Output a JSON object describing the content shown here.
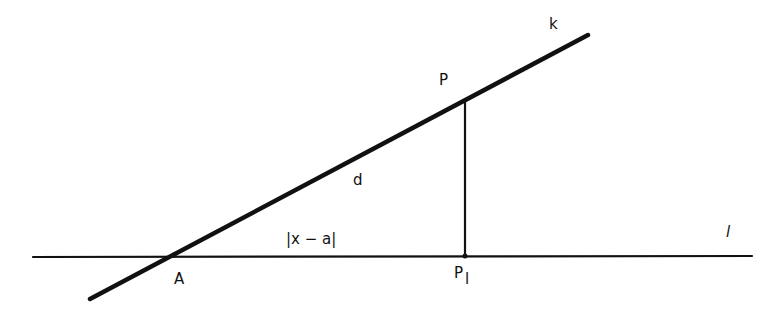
{
  "diagram": {
    "type": "geometry",
    "colors": {
      "stroke": "#111111",
      "background": "#ffffff"
    },
    "lines": {
      "l": {
        "x1": 33,
        "y1": 257,
        "x2": 752,
        "y2": 256
      },
      "k": {
        "x1": 90,
        "y1": 299,
        "x2": 588,
        "y2": 35
      },
      "perpendicular": {
        "x1": 465,
        "y1": 100,
        "x2": 465,
        "y2": 256
      }
    },
    "points": {
      "A": {
        "x": 174,
        "y": 255
      },
      "P": {
        "x": 465,
        "y": 100
      },
      "P_l": {
        "x": 465,
        "y": 256
      }
    },
    "labels": {
      "k": "k",
      "P": "P",
      "d": "d",
      "abs": "|x − a|",
      "l": "l",
      "A": "A",
      "P_l_main": "P",
      "P_l_sub": "l"
    }
  }
}
